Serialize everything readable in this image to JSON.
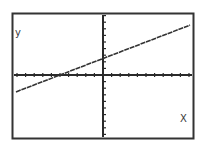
{
  "chart_data": {
    "type": "line",
    "title": "",
    "xlabel": "X",
    "ylabel": "y",
    "xlim": [
      -10,
      10
    ],
    "ylim": [
      -8,
      9
    ],
    "grid": false,
    "axis_ticks": {
      "x_step": 1,
      "y_step": 1
    },
    "series": [
      {
        "name": "y = 0.5x + 2.5",
        "slope": 0.5,
        "intercept": 2.5,
        "x": [
          -10,
          -5,
          0,
          10
        ],
        "y": [
          -2.5,
          0,
          2.5,
          7.5
        ]
      }
    ],
    "x_intercept": -5,
    "y_intercept": 2.5
  },
  "labels": {
    "x_axis": "X",
    "y_axis": "y"
  },
  "colors": {
    "frame": "#333333",
    "axis": "#2a2a2a",
    "line": "#333333",
    "background": "#ffffff"
  }
}
